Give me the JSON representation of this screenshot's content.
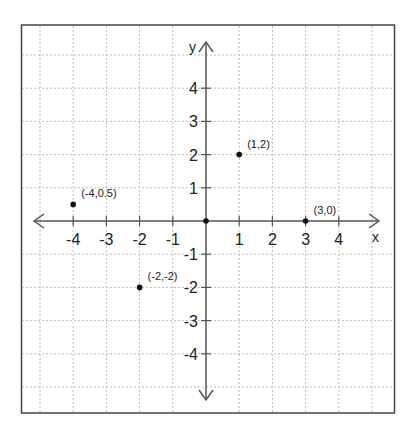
{
  "chart_data": {
    "type": "scatter",
    "title": "",
    "xlabel": "x",
    "ylabel": "y",
    "xlim": [
      -5,
      5
    ],
    "ylim": [
      -5,
      5
    ],
    "grid": true,
    "grid_style": "dotted",
    "x_ticks": [
      -4,
      -3,
      -2,
      -1,
      1,
      2,
      3,
      4
    ],
    "y_ticks": [
      4,
      3,
      2,
      1,
      -1,
      -2,
      -3,
      -4
    ],
    "points": [
      {
        "x": 1,
        "y": 2,
        "label": "(1,2)"
      },
      {
        "x": -4,
        "y": 0.5,
        "label": "(-4,0.5)"
      },
      {
        "x": 3,
        "y": 0,
        "label": "(3,0)"
      },
      {
        "x": -2,
        "y": -2,
        "label": "(-2,-2)"
      },
      {
        "x": 0,
        "y": 0,
        "label": ""
      }
    ]
  },
  "colors": {
    "frame": "#444444",
    "axis": "#555555",
    "grid": "#bbbbbb",
    "point": "#111111"
  }
}
